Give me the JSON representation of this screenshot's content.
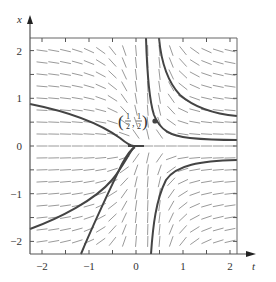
{
  "diagram": {
    "type": "direction-field",
    "axis_labels": {
      "horizontal": "t",
      "vertical": "x"
    },
    "t_ticks": [
      {
        "value": -2,
        "label": "−2"
      },
      {
        "value": -1,
        "label": "−1"
      },
      {
        "value": 0,
        "label": "0"
      },
      {
        "value": 1,
        "label": "1"
      },
      {
        "value": 2,
        "label": "2"
      }
    ],
    "x_ticks": [
      {
        "value": 2,
        "label": "2"
      },
      {
        "value": 1,
        "label": "1"
      },
      {
        "value": 0,
        "label": "0"
      },
      {
        "value": -1,
        "label": "−1"
      },
      {
        "value": -2,
        "label": "−2"
      }
    ],
    "t_range": [
      -2.25,
      2.15
    ],
    "x_range": [
      -2.3,
      2.25
    ],
    "equilibrium_point": {
      "t": 0.5,
      "x": 0.5,
      "label_open": "(",
      "label_num1": "1",
      "label_den1": "2",
      "label_sep": ",",
      "label_num2": "1",
      "label_den2": "2",
      "label_close": ")"
    },
    "colors": {
      "axis": "#555555",
      "field": "#9a9a9a",
      "curve": "#444444",
      "point": "#444444",
      "frame": "#666666"
    }
  }
}
